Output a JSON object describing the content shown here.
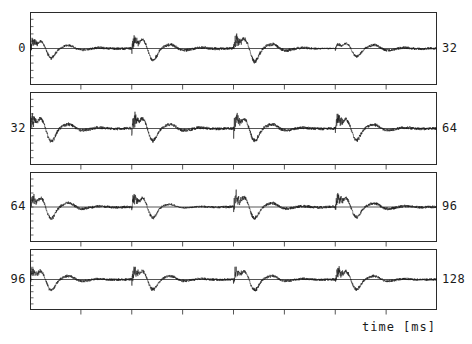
{
  "figure": {
    "kind": "multi-panel-waveform-plot",
    "background_color": "#ffffff",
    "line_color": "#1a1a1a",
    "axis_color": "#2b2b2b",
    "total_width": 472,
    "total_height": 344
  },
  "axes": {
    "x_title": "time [ms]",
    "x_units": "ms",
    "x_total_range": [
      0,
      128
    ],
    "left_labels": [
      "0",
      "32",
      "64",
      "96"
    ],
    "right_labels": [
      "32",
      "64",
      "96",
      "128"
    ],
    "x_major_ticks_per_panel": 8,
    "y_minor_ticks_per_panel": 10,
    "baseline": "zero-line"
  },
  "panels": [
    {
      "index": 0,
      "start_label": "0",
      "end_label": "32",
      "start_ms": 0,
      "end_ms": 32
    },
    {
      "index": 1,
      "start_label": "32",
      "end_label": "64",
      "start_ms": 32,
      "end_ms": 64
    },
    {
      "index": 2,
      "start_label": "64",
      "end_label": "96",
      "start_ms": 64,
      "end_ms": 96
    },
    {
      "index": 3,
      "start_label": "96",
      "end_label": "128",
      "start_ms": 96,
      "end_ms": 128
    }
  ],
  "chart_data": {
    "type": "line",
    "title": "",
    "subtitle": "",
    "xlabel": "time [ms]",
    "ylabel": "",
    "grid": false,
    "legend": null,
    "x": [
      0,
      128
    ],
    "xlim": [
      0,
      128
    ],
    "ylim": [
      -1,
      1
    ],
    "panel_count": 4,
    "panel_span_ms": 32,
    "series": [
      {
        "name": "waveform 0-32 ms",
        "panel": 0,
        "fundamental_hz": 132,
        "envelope": [
          {
            "t": 0,
            "a": 0.6
          },
          {
            "t": 2,
            "a": 0.72
          },
          {
            "t": 4,
            "a": 0.68
          },
          {
            "t": 6,
            "a": 0.8
          },
          {
            "t": 8,
            "a": 0.74
          },
          {
            "t": 10,
            "a": 0.88
          },
          {
            "t": 12,
            "a": 0.82
          },
          {
            "t": 14,
            "a": 0.9
          },
          {
            "t": 16,
            "a": 0.85
          },
          {
            "t": 18,
            "a": 0.95
          },
          {
            "t": 20,
            "a": 0.92
          },
          {
            "t": 22,
            "a": 0.78
          },
          {
            "t": 24,
            "a": 0.3
          },
          {
            "t": 26,
            "a": 0.66
          },
          {
            "t": 28,
            "a": 0.84
          },
          {
            "t": 30,
            "a": 0.8
          },
          {
            "t": 32,
            "a": 0.76
          }
        ]
      },
      {
        "name": "waveform 32-64 ms",
        "panel": 1,
        "fundamental_hz": 132,
        "envelope": [
          {
            "t": 32,
            "a": 0.88
          },
          {
            "t": 34,
            "a": 0.95
          },
          {
            "t": 36,
            "a": 0.9
          },
          {
            "t": 38,
            "a": 0.86
          },
          {
            "t": 40,
            "a": 0.92
          },
          {
            "t": 42,
            "a": 0.88
          },
          {
            "t": 44,
            "a": 0.94
          },
          {
            "t": 46,
            "a": 0.9
          },
          {
            "t": 48,
            "a": 0.84
          },
          {
            "t": 50,
            "a": 0.92
          },
          {
            "t": 52,
            "a": 0.88
          },
          {
            "t": 54,
            "a": 0.82
          },
          {
            "t": 56,
            "a": 0.9
          },
          {
            "t": 58,
            "a": 0.86
          },
          {
            "t": 60,
            "a": 0.8
          },
          {
            "t": 62,
            "a": 0.88
          },
          {
            "t": 64,
            "a": 0.84
          }
        ]
      },
      {
        "name": "waveform 64-96 ms",
        "panel": 2,
        "fundamental_hz": 132,
        "envelope": [
          {
            "t": 64,
            "a": 0.84
          },
          {
            "t": 66,
            "a": 0.9
          },
          {
            "t": 68,
            "a": 0.86
          },
          {
            "t": 70,
            "a": 0.78
          },
          {
            "t": 72,
            "a": 0.88
          },
          {
            "t": 74,
            "a": 0.8
          },
          {
            "t": 76,
            "a": 0.4
          },
          {
            "t": 78,
            "a": 0.62
          },
          {
            "t": 80,
            "a": 0.92
          },
          {
            "t": 82,
            "a": 0.88
          },
          {
            "t": 84,
            "a": 0.84
          },
          {
            "t": 86,
            "a": 0.9
          },
          {
            "t": 88,
            "a": 0.86
          },
          {
            "t": 90,
            "a": 0.8
          },
          {
            "t": 92,
            "a": 0.88
          },
          {
            "t": 94,
            "a": 0.82
          },
          {
            "t": 96,
            "a": 0.86
          }
        ]
      },
      {
        "name": "waveform 96-128 ms",
        "panel": 3,
        "fundamental_hz": 132,
        "envelope": [
          {
            "t": 96,
            "a": 0.9
          },
          {
            "t": 98,
            "a": 0.95
          },
          {
            "t": 100,
            "a": 0.92
          },
          {
            "t": 102,
            "a": 0.88
          },
          {
            "t": 104,
            "a": 0.94
          },
          {
            "t": 106,
            "a": 0.9
          },
          {
            "t": 108,
            "a": 0.86
          },
          {
            "t": 110,
            "a": 0.92
          },
          {
            "t": 112,
            "a": 0.88
          },
          {
            "t": 114,
            "a": 0.94
          },
          {
            "t": 116,
            "a": 0.9
          },
          {
            "t": 118,
            "a": 0.84
          },
          {
            "t": 120,
            "a": 0.92
          },
          {
            "t": 122,
            "a": 0.88
          },
          {
            "t": 124,
            "a": 0.9
          },
          {
            "t": 126,
            "a": 0.86
          },
          {
            "t": 128,
            "a": 0.82
          }
        ]
      }
    ]
  }
}
